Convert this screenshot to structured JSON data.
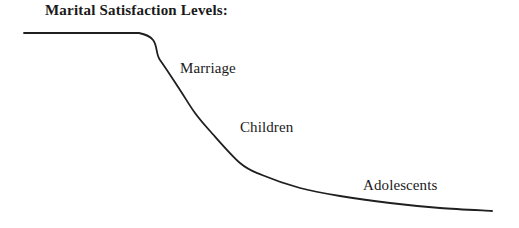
{
  "figure": {
    "title": "Marital Satisfaction Levels:",
    "background_color": "#ffffff",
    "line_color": "#1f1f1f",
    "text_color": "#1a1a1a"
  },
  "labels": {
    "marriage": "Marriage",
    "children": "Children",
    "adolescents": "Adolescents"
  },
  "chart_data": {
    "type": "line",
    "title": "Marital Satisfaction Levels:",
    "xlabel": "",
    "ylabel": "",
    "grid": false,
    "legend": "none",
    "axes_visible": false,
    "series": [
      {
        "name": "Marital Satisfaction",
        "description": "Satisfaction remains high and flat through early marriage, declines steeply after children arrive, then levels off at a low plateau during the adolescent years.",
        "points": [
          {
            "x": 24,
            "y": 33
          },
          {
            "x": 139,
            "y": 33
          },
          {
            "x": 160,
            "y": 60
          },
          {
            "x": 180,
            "y": 90
          },
          {
            "x": 195,
            "y": 113
          },
          {
            "x": 210,
            "y": 131
          },
          {
            "x": 240,
            "y": 163
          },
          {
            "x": 262,
            "y": 175
          },
          {
            "x": 300,
            "y": 188
          },
          {
            "x": 340,
            "y": 196
          },
          {
            "x": 390,
            "y": 203
          },
          {
            "x": 440,
            "y": 208
          },
          {
            "x": 492,
            "y": 211
          }
        ]
      }
    ],
    "annotations": [
      {
        "text": "Marriage",
        "x": 180,
        "y": 60
      },
      {
        "text": "Children",
        "x": 240,
        "y": 119
      },
      {
        "text": "Adolescents",
        "x": 363,
        "y": 177
      }
    ]
  }
}
